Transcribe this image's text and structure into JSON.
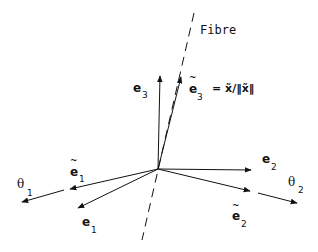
{
  "diagram": {
    "fibre_label": "Fibre",
    "vectors": {
      "e1": {
        "base": "e",
        "sub": "1",
        "tilde": false
      },
      "e2": {
        "base": "e",
        "sub": "2",
        "tilde": false
      },
      "e3": {
        "base": "e",
        "sub": "3",
        "tilde": false
      },
      "e1_tilde": {
        "base": "e",
        "sub": "1",
        "tilde": true
      },
      "e2_tilde": {
        "base": "e",
        "sub": "2",
        "tilde": true
      },
      "e3_tilde": {
        "base": "e",
        "sub": "3",
        "tilde": true
      }
    },
    "e3_tilde_definition": "= x̃/‖x̃‖",
    "angles": {
      "theta1": {
        "base": "θ",
        "sub": "1"
      },
      "theta2": {
        "base": "θ",
        "sub": "2"
      }
    },
    "tilde_glyph": "~",
    "colors": {
      "stroke": "#111111",
      "background": "#ffffff"
    }
  }
}
